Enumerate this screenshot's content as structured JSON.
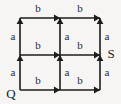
{
  "diagram": {
    "type": "state-transition-grid",
    "width": 121,
    "height": 104,
    "background_color": "#f6f5f3",
    "line_color": "#1c1c1c",
    "text_color": "#1c1c1c",
    "grid": {
      "columns_x": [
        20,
        60,
        100
      ],
      "rows_y": [
        18,
        55,
        90
      ]
    },
    "node_labels": [
      {
        "id": "node-q",
        "text": "Q",
        "x": 11,
        "y": 95,
        "at_node": "bottom-left"
      },
      {
        "id": "node-s",
        "text": "S",
        "x": 111,
        "y": 55,
        "at_node": "middle-right"
      }
    ],
    "horizontal_edges": [
      {
        "id": "h-top-left",
        "label": "b",
        "from_x": 20,
        "to_x": 60,
        "y": 18,
        "label_x": 38,
        "label_y": 9,
        "direction": "right"
      },
      {
        "id": "h-top-right",
        "label": "b",
        "from_x": 60,
        "to_x": 100,
        "y": 18,
        "label_x": 80,
        "label_y": 9,
        "direction": "right"
      },
      {
        "id": "h-mid-left",
        "label": "b",
        "from_x": 20,
        "to_x": 60,
        "y": 55,
        "label_x": 38,
        "label_y": 46,
        "direction": "right"
      },
      {
        "id": "h-mid-right",
        "label": "b",
        "from_x": 60,
        "to_x": 100,
        "y": 55,
        "label_x": 80,
        "label_y": 46,
        "direction": "right"
      },
      {
        "id": "h-bot-left",
        "label": "b",
        "from_x": 20,
        "to_x": 60,
        "y": 90,
        "label_x": 38,
        "label_y": 81,
        "direction": "right"
      },
      {
        "id": "h-bot-right",
        "label": "b",
        "from_x": 60,
        "to_x": 100,
        "y": 90,
        "label_x": 80,
        "label_y": 81,
        "direction": "right"
      }
    ],
    "vertical_edges": [
      {
        "id": "v-left-upper",
        "label": "a",
        "x": 20,
        "from_y": 55,
        "to_y": 18,
        "label_x": 13,
        "label_y": 37,
        "direction": "up"
      },
      {
        "id": "v-left-lower",
        "label": "a",
        "x": 20,
        "from_y": 90,
        "to_y": 55,
        "label_x": 13,
        "label_y": 73,
        "direction": "up"
      },
      {
        "id": "v-mid-upper",
        "label": "a",
        "x": 60,
        "from_y": 55,
        "to_y": 18,
        "label_x": 67,
        "label_y": 37,
        "direction": "up"
      },
      {
        "id": "v-mid-lower",
        "label": "a",
        "x": 60,
        "from_y": 90,
        "to_y": 55,
        "label_x": 67,
        "label_y": 73,
        "direction": "up"
      },
      {
        "id": "v-right-upper",
        "label": "a",
        "x": 100,
        "from_y": 55,
        "to_y": 18,
        "label_x": 107,
        "label_y": 37,
        "direction": "up"
      },
      {
        "id": "v-right-lower",
        "label": "a",
        "x": 100,
        "from_y": 90,
        "to_y": 55,
        "label_x": 107,
        "label_y": 73,
        "direction": "up"
      }
    ],
    "alphabet": [
      "a",
      "b"
    ],
    "start_state": "Q",
    "accept_state": "S"
  }
}
